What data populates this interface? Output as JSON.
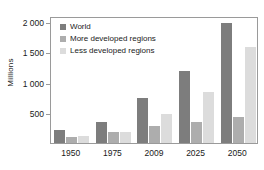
{
  "chart_data": {
    "type": "bar",
    "title": "",
    "subtitle": "",
    "xlabel": "",
    "ylabel": "Millions",
    "categories": [
      "1950",
      "1975",
      "2009",
      "2025",
      "2050"
    ],
    "series": [
      {
        "name": "World",
        "color": "#7d7d7d",
        "values": [
          215,
          355,
          750,
          1190,
          1980
        ]
      },
      {
        "name": "More developed regions",
        "color": "#adadad",
        "values": [
          95,
          175,
          280,
          350,
          430
        ]
      },
      {
        "name": "Less developed regions",
        "color": "#dcdcdc",
        "values": [
          120,
          185,
          475,
          840,
          1580
        ]
      }
    ],
    "ylim": [
      0,
      2100
    ],
    "yticks": [
      500,
      1000,
      1500,
      2000
    ],
    "ytick_labels": [
      "500",
      "1 000",
      "1 500",
      "2 000"
    ],
    "grid": false,
    "legend_position": "upper-left",
    "axis_color": "#9a9a9a",
    "text_color": "#1a1a1a",
    "background": "#ffffff"
  }
}
